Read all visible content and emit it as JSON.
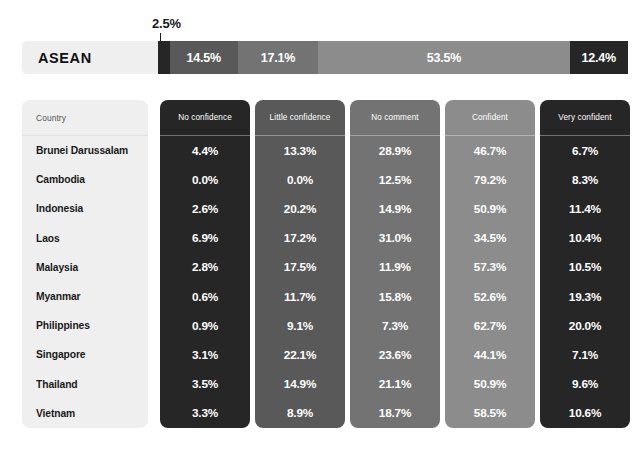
{
  "summary": {
    "region_label": "ASEAN",
    "callout_value": "2.5%",
    "segments": [
      {
        "label": "No confidence",
        "value": "2.5%",
        "pct": 2.5,
        "color": "#262626",
        "show_label": false
      },
      {
        "label": "Little confidence",
        "value": "14.5%",
        "pct": 14.5,
        "color": "#595959",
        "show_label": true
      },
      {
        "label": "No comment",
        "value": "17.1%",
        "pct": 17.1,
        "color": "#737373",
        "show_label": true
      },
      {
        "label": "Confident",
        "value": "53.5%",
        "pct": 53.5,
        "color": "#8c8c8c",
        "show_label": true
      },
      {
        "label": "Very confident",
        "value": "12.4%",
        "pct": 12.4,
        "color": "#262626",
        "show_label": true
      }
    ]
  },
  "table": {
    "columns": [
      {
        "key": "country",
        "label": "Country",
        "color": "#efefef"
      },
      {
        "key": "no_confidence",
        "label": "No confidence",
        "color": "#262626"
      },
      {
        "key": "little_confidence",
        "label": "Little confidence",
        "color": "#595959"
      },
      {
        "key": "no_comment",
        "label": "No comment",
        "color": "#737373"
      },
      {
        "key": "confident",
        "label": "Confident",
        "color": "#8c8c8c"
      },
      {
        "key": "very_confident",
        "label": "Very confident",
        "color": "#262626"
      }
    ],
    "rows": [
      {
        "country": "Brunei Darussalam",
        "no_confidence": "4.4%",
        "little_confidence": "13.3%",
        "no_comment": "28.9%",
        "confident": "46.7%",
        "very_confident": "6.7%"
      },
      {
        "country": "Cambodia",
        "no_confidence": "0.0%",
        "little_confidence": "0.0%",
        "no_comment": "12.5%",
        "confident": "79.2%",
        "very_confident": "8.3%"
      },
      {
        "country": "Indonesia",
        "no_confidence": "2.6%",
        "little_confidence": "20.2%",
        "no_comment": "14.9%",
        "confident": "50.9%",
        "very_confident": "11.4%"
      },
      {
        "country": "Laos",
        "no_confidence": "6.9%",
        "little_confidence": "17.2%",
        "no_comment": "31.0%",
        "confident": "34.5%",
        "very_confident": "10.4%"
      },
      {
        "country": "Malaysia",
        "no_confidence": "2.8%",
        "little_confidence": "17.5%",
        "no_comment": "11.9%",
        "confident": "57.3%",
        "very_confident": "10.5%"
      },
      {
        "country": "Myanmar",
        "no_confidence": "0.6%",
        "little_confidence": "11.7%",
        "no_comment": "15.8%",
        "confident": "52.6%",
        "very_confident": "19.3%"
      },
      {
        "country": "Philippines",
        "no_confidence": "0.9%",
        "little_confidence": "9.1%",
        "no_comment": "7.3%",
        "confident": "62.7%",
        "very_confident": "20.0%"
      },
      {
        "country": "Singapore",
        "no_confidence": "3.1%",
        "little_confidence": "22.1%",
        "no_comment": "23.6%",
        "confident": "44.1%",
        "very_confident": "7.1%"
      },
      {
        "country": "Thailand",
        "no_confidence": "3.5%",
        "little_confidence": "14.9%",
        "no_comment": "21.1%",
        "confident": "50.9%",
        "very_confident": "9.6%"
      },
      {
        "country": "Vietnam",
        "no_confidence": "3.3%",
        "little_confidence": "8.9%",
        "no_comment": "18.7%",
        "confident": "58.5%",
        "very_confident": "10.6%"
      }
    ]
  },
  "chart_data": {
    "type": "bar",
    "title": "",
    "categories": [
      "ASEAN",
      "Brunei Darussalam",
      "Cambodia",
      "Indonesia",
      "Laos",
      "Malaysia",
      "Myanmar",
      "Philippines",
      "Singapore",
      "Thailand",
      "Vietnam"
    ],
    "series": [
      {
        "name": "No confidence",
        "values": [
          2.5,
          4.4,
          0.0,
          2.6,
          6.9,
          2.8,
          0.6,
          0.9,
          3.1,
          3.5,
          3.3
        ],
        "color": "#262626"
      },
      {
        "name": "Little confidence",
        "values": [
          14.5,
          13.3,
          0.0,
          20.2,
          17.2,
          17.5,
          11.7,
          9.1,
          22.1,
          14.9,
          8.9
        ],
        "color": "#595959"
      },
      {
        "name": "No comment",
        "values": [
          17.1,
          28.9,
          12.5,
          14.9,
          31.0,
          11.9,
          15.8,
          7.3,
          23.6,
          21.1,
          18.7
        ],
        "color": "#737373"
      },
      {
        "name": "Confident",
        "values": [
          53.5,
          46.7,
          79.2,
          50.9,
          34.5,
          57.3,
          52.6,
          62.7,
          44.1,
          50.9,
          58.5
        ],
        "color": "#8c8c8c"
      },
      {
        "name": "Very confident",
        "values": [
          12.4,
          6.7,
          8.3,
          11.4,
          10.4,
          10.5,
          19.3,
          20.0,
          7.1,
          9.6,
          10.6
        ],
        "color": "#262626"
      }
    ],
    "xlabel": "",
    "ylabel": "",
    "ylim": [
      0,
      100
    ],
    "grid": false,
    "legend": "top"
  }
}
